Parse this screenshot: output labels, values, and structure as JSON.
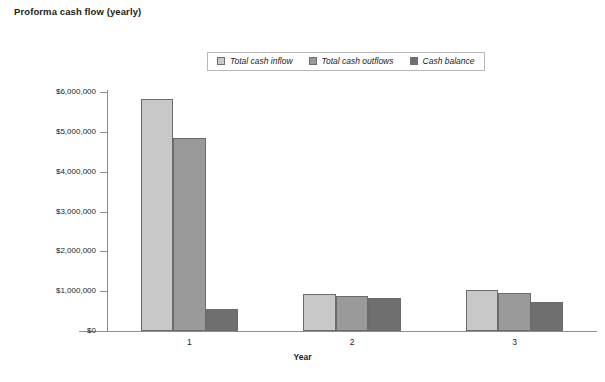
{
  "chart_data": {
    "type": "bar",
    "title": "Proforma cash flow (yearly)",
    "xlabel": "Year",
    "ylabel": "",
    "categories": [
      "1",
      "2",
      "3"
    ],
    "series": [
      {
        "name": "Total cash inflow",
        "values": [
          5820000,
          920000,
          1030000
        ],
        "color": "#c8c8c8"
      },
      {
        "name": "Total cash outflows",
        "values": [
          4850000,
          870000,
          950000
        ],
        "color": "#9a9a9a"
      },
      {
        "name": "Cash balance",
        "values": [
          560000,
          840000,
          720000
        ],
        "color": "#6f6f6f"
      }
    ],
    "ylim": [
      0,
      6000000
    ],
    "ytick_labels": [
      "$0",
      "$1,000,000",
      "$2,000,000",
      "$3,000,000",
      "$4,000,000",
      "$5,000,000",
      "$6,000,000"
    ],
    "ytick_values": [
      0,
      1000000,
      2000000,
      3000000,
      4000000,
      5000000,
      6000000
    ],
    "grid": false,
    "legend_position": "top-center",
    "axis_color": "#8e8e8e",
    "bar_border_color": "#6b6b6b",
    "background": "#ffffff"
  }
}
